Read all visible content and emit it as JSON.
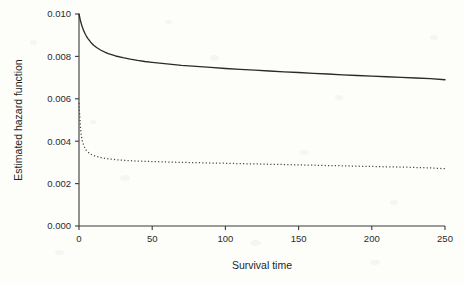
{
  "chart_data": {
    "type": "line",
    "title": "",
    "subtitle": "",
    "xlabel": "Survival time",
    "ylabel": "Estimated hazard function",
    "xlim": [
      0,
      250
    ],
    "ylim": [
      0.0,
      0.01
    ],
    "xticks": [
      0,
      50,
      100,
      150,
      200,
      250
    ],
    "yticks": [
      0.0,
      0.002,
      0.004,
      0.006,
      0.008,
      0.01
    ],
    "xtick_labels": [
      "0",
      "50",
      "100",
      "150",
      "200",
      "250"
    ],
    "ytick_labels": [
      "0.000",
      "0.002",
      "0.004",
      "0.006",
      "0.008",
      "0.010"
    ],
    "grid": false,
    "legend": null,
    "legend_position": "none",
    "annotations": [],
    "series": [
      {
        "name": "solid-hazard",
        "style": "solid",
        "color": "#2a2a2a",
        "x": [
          0,
          1,
          2,
          3,
          4,
          5,
          6,
          8,
          10,
          12,
          15,
          18,
          20,
          25,
          30,
          35,
          40,
          45,
          50,
          60,
          70,
          80,
          90,
          100,
          110,
          120,
          130,
          140,
          150,
          160,
          170,
          180,
          190,
          200,
          210,
          220,
          230,
          240,
          250
        ],
        "y": [
          0.01,
          0.00968,
          0.00944,
          0.00925,
          0.00909,
          0.00896,
          0.00885,
          0.00867,
          0.00853,
          0.00842,
          0.00829,
          0.00819,
          0.00813,
          0.00802,
          0.00794,
          0.00787,
          0.00781,
          0.00776,
          0.00772,
          0.00765,
          0.00758,
          0.00753,
          0.00748,
          0.00743,
          0.00739,
          0.00735,
          0.00731,
          0.00727,
          0.00724,
          0.0072,
          0.00717,
          0.00713,
          0.0071,
          0.00707,
          0.00704,
          0.00701,
          0.00698,
          0.00695,
          0.0069
        ]
      },
      {
        "name": "dotted-hazard",
        "style": "dotted",
        "color": "#474747",
        "x": [
          0,
          0.4,
          1,
          1.6,
          2.2,
          3,
          4,
          5,
          6,
          8,
          10,
          12,
          15,
          18,
          20,
          25,
          30,
          35,
          40,
          45,
          50,
          60,
          70,
          80,
          90,
          100,
          110,
          120,
          130,
          140,
          150,
          160,
          170,
          180,
          190,
          200,
          210,
          220,
          230,
          240,
          250
        ],
        "y": [
          0.0058,
          0.0053,
          0.00465,
          0.00425,
          0.00402,
          0.00385,
          0.00368,
          0.00357,
          0.00349,
          0.00339,
          0.00332,
          0.00328,
          0.00323,
          0.00319,
          0.00317,
          0.00313,
          0.0031,
          0.00308,
          0.00306,
          0.00305,
          0.00304,
          0.00302,
          0.003,
          0.00299,
          0.00297,
          0.00296,
          0.00294,
          0.00293,
          0.00291,
          0.0029,
          0.00288,
          0.00287,
          0.00285,
          0.00284,
          0.00282,
          0.00281,
          0.00279,
          0.00278,
          0.00276,
          0.00274,
          0.0027
        ]
      }
    ]
  },
  "figure": {
    "background_color": "#fdfdfa",
    "axis_color": "#3a3a3a",
    "text_color": "#1f1f1f"
  }
}
